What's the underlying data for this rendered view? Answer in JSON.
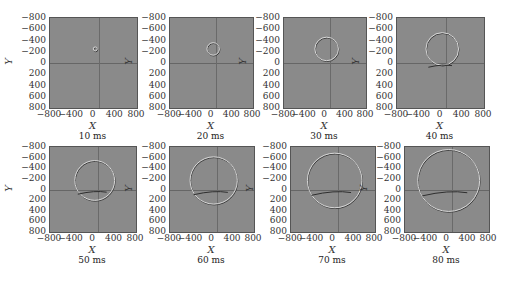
{
  "figure": {
    "panels": [
      {
        "caption": "10 ms",
        "time_ms": 10
      },
      {
        "caption": "20 ms",
        "time_ms": 20
      },
      {
        "caption": "30 ms",
        "time_ms": 30
      },
      {
        "caption": "40 ms",
        "time_ms": 40
      },
      {
        "caption": "50 ms",
        "time_ms": 50
      },
      {
        "caption": "60 ms",
        "time_ms": 60
      },
      {
        "caption": "70 ms",
        "time_ms": 70
      },
      {
        "caption": "80 ms",
        "time_ms": 80
      }
    ],
    "xlabel": "X",
    "ylabel": "Y",
    "xticks": [
      "−800",
      "−400",
      "0",
      "400",
      "800"
    ],
    "yticks": [
      "−800",
      "−600",
      "−400",
      "−200",
      "0",
      "200",
      "400",
      "600",
      "800"
    ]
  },
  "chart_data": {
    "type": "heatmap",
    "xlabel": "X",
    "ylabel": "Y",
    "xlim": [
      -800,
      800
    ],
    "ylim": [
      800,
      -800
    ],
    "xticks": [
      -800,
      -400,
      0,
      400,
      800
    ],
    "yticks": [
      -800,
      -600,
      -400,
      -200,
      0,
      200,
      400,
      600,
      800
    ],
    "grid": false,
    "layout": "2 rows x 4 columns",
    "snapshots": [
      {
        "time_ms": 10,
        "source_x": 0,
        "source_y": -250,
        "wavefront_radius": 20
      },
      {
        "time_ms": 20,
        "source_x": 0,
        "source_y": -250,
        "wavefront_radius": 120
      },
      {
        "time_ms": 30,
        "source_x": 0,
        "source_y": -250,
        "wavefront_radius": 230
      },
      {
        "time_ms": 40,
        "source_x": 0,
        "source_y": -250,
        "wavefront_radius": 300
      },
      {
        "time_ms": 50,
        "source_x": 0,
        "source_y": -250,
        "wavefront_radius": 370
      },
      {
        "time_ms": 60,
        "source_x": 0,
        "source_y": -250,
        "wavefront_radius": 450
      },
      {
        "time_ms": 70,
        "source_x": 0,
        "source_y": -250,
        "wavefront_radius": 520
      },
      {
        "time_ms": 80,
        "source_x": 0,
        "source_y": -250,
        "wavefront_radius": 590
      }
    ]
  }
}
